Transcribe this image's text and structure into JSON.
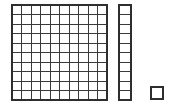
{
  "scene": {
    "title": "Base Ten Blocks",
    "background_color": "#ffffff",
    "line_color": "#3a3a3a",
    "outline_color": "#2e2e2e",
    "fill_color": "#ffffff",
    "width": 169,
    "height": 107
  },
  "blocks": [
    {
      "name": "hundred-flat",
      "label": "Hundred flat",
      "value": 100,
      "rows": 10,
      "columns": 10,
      "unit_count": 100,
      "x": 12,
      "y": 5,
      "cell_size": 9.5
    },
    {
      "name": "ten-rod",
      "label": "Ten rod",
      "value": 10,
      "rows": 10,
      "columns": 1,
      "unit_count": 10,
      "x": 119,
      "y": 5,
      "cell_size": 9.5,
      "cell_width": 12
    },
    {
      "name": "one-unit",
      "label": "One unit",
      "value": 1,
      "rows": 1,
      "columns": 1,
      "unit_count": 1,
      "x": 151,
      "y": 87,
      "cell_size": 12
    }
  ],
  "total": {
    "value": 111,
    "hundreds": 1,
    "tens": 1,
    "ones": 1
  }
}
